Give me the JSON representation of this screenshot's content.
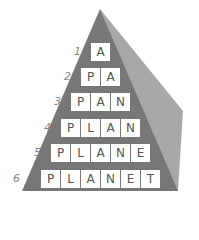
{
  "colors": {
    "front_face": "#777777",
    "side_face": "#a8a8a8",
    "cell_bg": "#ffffff",
    "letter": "#555555",
    "number": "#888888"
  },
  "rows": [
    {
      "number": "1",
      "word": "A",
      "letters": [
        "A"
      ]
    },
    {
      "number": "2",
      "word": "PA",
      "letters": [
        "P",
        "A"
      ]
    },
    {
      "number": "3",
      "word": "PAN",
      "letters": [
        "P",
        "A",
        "N"
      ]
    },
    {
      "number": "4",
      "word": "PLAN",
      "letters": [
        "P",
        "L",
        "A",
        "N"
      ]
    },
    {
      "number": "5",
      "word": "PLANE",
      "letters": [
        "P",
        "L",
        "A",
        "N",
        "E"
      ]
    },
    {
      "number": "6",
      "word": "PLANET",
      "letters": [
        "P",
        "L",
        "A",
        "N",
        "E",
        "T"
      ]
    }
  ]
}
